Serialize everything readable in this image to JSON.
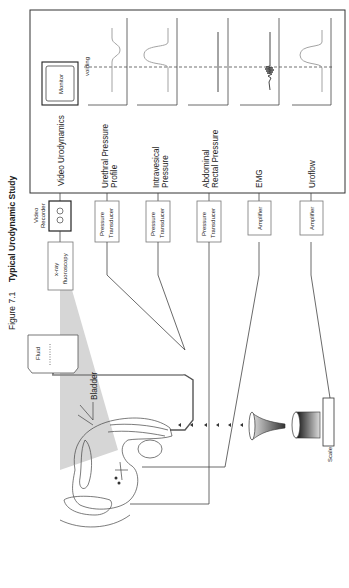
{
  "figure": {
    "number": "Figure 7.1",
    "title": "Typical Urodynamic Study",
    "orientation": "rotated 90deg counter-clockwise"
  },
  "recorder_panel": {
    "monitor_label": "Monitor",
    "marker_label": "voiding",
    "channels": [
      {
        "label_line1": "Video Urodynamics",
        "label_line2": "",
        "trace": "monitor"
      },
      {
        "label_line1": "Urethral Pressure",
        "label_line2": "Profile",
        "trace": "dip"
      },
      {
        "label_line1": "Intravesical",
        "label_line2": "Pressure",
        "trace": "peak"
      },
      {
        "label_line1": "Abdominal",
        "label_line2": "Rectal Pressure",
        "trace": "flat"
      },
      {
        "label_line1": "EMG",
        "label_line2": "",
        "trace": "burst"
      },
      {
        "label_line1": "Uroflow",
        "label_line2": "",
        "trace": "peak"
      }
    ]
  },
  "devices": {
    "video_recorder": {
      "line1": "Video",
      "line2": "Recorder"
    },
    "xray": {
      "line1": "x-ray",
      "line2": "fluoroscopy"
    },
    "transducers": [
      {
        "line1": "Pressure",
        "line2": "Transducer"
      },
      {
        "line1": "Pressure",
        "line2": "Transducer"
      },
      {
        "line1": "Pressure",
        "line2": "Transducer"
      }
    ],
    "amplifiers": [
      {
        "label": "Amplifier"
      },
      {
        "label": "Amplifier"
      }
    ],
    "fluid": "Fluid",
    "bladder": "Bladder",
    "scale": "Scale"
  },
  "colors": {
    "line": "#333333",
    "trace": "#999999",
    "xray_beam": "#d4d4d4"
  }
}
